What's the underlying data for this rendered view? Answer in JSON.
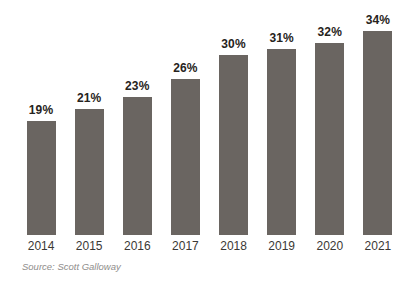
{
  "chart_data": {
    "type": "bar",
    "categories": [
      "2014",
      "2015",
      "2016",
      "2017",
      "2018",
      "2019",
      "2020",
      "2021"
    ],
    "values": [
      19,
      21,
      23,
      26,
      30,
      31,
      32,
      34
    ],
    "value_labels": [
      "19%",
      "21%",
      "23%",
      "26%",
      "30%",
      "31%",
      "32%",
      "34%"
    ],
    "title": "",
    "xlabel": "",
    "ylabel": "",
    "ylim": [
      0,
      35
    ],
    "grid": false,
    "legend": false,
    "bar_color": "#6a6561",
    "source_note": "Source: Scott Galloway"
  }
}
